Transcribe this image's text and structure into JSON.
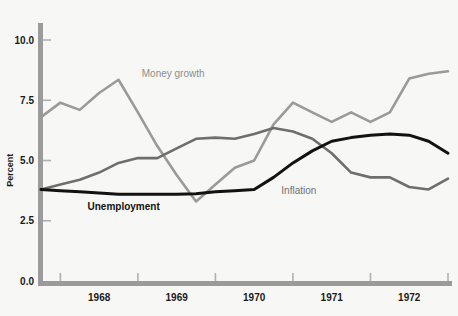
{
  "chart_data": {
    "type": "line",
    "title": "",
    "subtitle": "",
    "xlabel": "",
    "ylabel": "Percent",
    "ylim": [
      0.0,
      10.8
    ],
    "yticks": [
      0.0,
      2.5,
      5.0,
      7.5,
      10.0
    ],
    "ytick_labels": [
      "0.0",
      "2.5",
      "5.0",
      "7.5",
      "10.0"
    ],
    "xlim": [
      1967.75,
      1973.0
    ],
    "xticks": [
      1968.0,
      1969.0,
      1970.0,
      1971.0,
      1972.0,
      1973.0
    ],
    "xtick_labels": [
      "1968",
      "1969",
      "1970",
      "1971",
      "1972"
    ],
    "xtick_label_positions": [
      1968.5,
      1969.5,
      1970.5,
      1971.5,
      1972.5
    ],
    "grid": false,
    "legend_position": "inline-annotations",
    "x": [
      1967.75,
      1968.0,
      1968.25,
      1968.5,
      1968.75,
      1969.0,
      1969.25,
      1969.5,
      1969.75,
      1970.0,
      1970.25,
      1970.5,
      1970.75,
      1971.0,
      1971.25,
      1971.5,
      1971.75,
      1972.0,
      1972.25,
      1972.5,
      1972.75,
      1973.0
    ],
    "series": [
      {
        "name": "Money growth",
        "color": "#9a9a9a",
        "linewidth": 2.6,
        "label_x": 1969.05,
        "label_y": 8.45,
        "values": [
          6.8,
          7.4,
          7.1,
          7.8,
          8.35,
          7.0,
          5.6,
          4.4,
          3.3,
          4.0,
          4.7,
          5.0,
          6.5,
          7.4,
          7.0,
          6.6,
          7.0,
          6.6,
          7.0,
          8.4,
          8.6,
          8.7
        ]
      },
      {
        "name": "Inflation",
        "color": "#6e6e6e",
        "linewidth": 2.6,
        "label_x": 1970.85,
        "label_y": 3.6,
        "values": [
          3.8,
          4.0,
          4.2,
          4.5,
          4.9,
          5.1,
          5.1,
          5.5,
          5.9,
          5.95,
          5.9,
          6.1,
          6.35,
          6.2,
          5.9,
          5.3,
          4.5,
          4.3,
          4.3,
          3.9,
          3.8,
          4.25
        ]
      },
      {
        "name": "Unemployment",
        "color": "#121212",
        "linewidth": 3.0,
        "label_x": 1968.35,
        "label_y": 2.95,
        "values": [
          3.8,
          3.75,
          3.7,
          3.65,
          3.6,
          3.6,
          3.6,
          3.6,
          3.62,
          3.7,
          3.75,
          3.8,
          4.3,
          4.9,
          5.4,
          5.8,
          5.95,
          6.05,
          6.1,
          6.05,
          5.8,
          5.3
        ]
      }
    ]
  },
  "axis": {
    "y_axis_color": "#9b9b9b",
    "x_axis_color": "#9b9b9b",
    "tick_color": "#b0b0b0",
    "background": "#f7f7f5"
  }
}
